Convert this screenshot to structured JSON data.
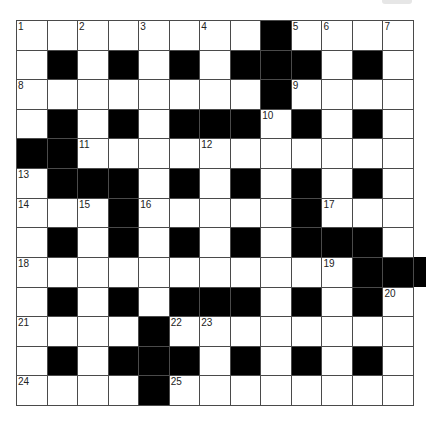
{
  "puzzle": {
    "type": "crossword",
    "rows": 13,
    "cols": 13,
    "colors": {
      "block": "#000000",
      "cell": "#ffffff",
      "gridline": "#4a4a4a"
    },
    "layout": [
      "WWWWWWWWBWWWW",
      "WBWBWBWBBBWBW",
      "WWWWWWWWBWWWW",
      "WBWBWBBBWBWBW",
      "BBWWWWWWWWWWW",
      "WBBBWBWBWBWBW",
      "WWWBWWWWWBWWW",
      "WBWBWBWBWBBBW",
      "WWWWWWWWWWWBB",
      "WBWBWBBBWBWBW",
      "WWWWBWWWWWWWW",
      "WBWBBBWBWBWBW",
      "WWWWBWWWWWWWW"
    ],
    "numbers": [
      {
        "row": 0,
        "col": 0,
        "n": "1"
      },
      {
        "row": 0,
        "col": 2,
        "n": "2"
      },
      {
        "row": 0,
        "col": 4,
        "n": "3"
      },
      {
        "row": 0,
        "col": 6,
        "n": "4"
      },
      {
        "row": 0,
        "col": 9,
        "n": "5"
      },
      {
        "row": 0,
        "col": 10,
        "n": "6"
      },
      {
        "row": 0,
        "col": 12,
        "n": "7"
      },
      {
        "row": 2,
        "col": 0,
        "n": "8"
      },
      {
        "row": 2,
        "col": 9,
        "n": "9"
      },
      {
        "row": 3,
        "col": 8,
        "n": "10"
      },
      {
        "row": 4,
        "col": 2,
        "n": "11"
      },
      {
        "row": 4,
        "col": 6,
        "n": "12"
      },
      {
        "row": 5,
        "col": 0,
        "n": "13"
      },
      {
        "row": 6,
        "col": 0,
        "n": "14"
      },
      {
        "row": 6,
        "col": 2,
        "n": "15"
      },
      {
        "row": 6,
        "col": 4,
        "n": "16"
      },
      {
        "row": 6,
        "col": 10,
        "n": "17"
      },
      {
        "row": 8,
        "col": 0,
        "n": "18"
      },
      {
        "row": 8,
        "col": 10,
        "n": "19"
      },
      {
        "row": 9,
        "col": 12,
        "n": "20"
      },
      {
        "row": 10,
        "col": 0,
        "n": "21"
      },
      {
        "row": 10,
        "col": 5,
        "n": "22"
      },
      {
        "row": 10,
        "col": 6,
        "n": "23"
      },
      {
        "row": 12,
        "col": 0,
        "n": "24"
      },
      {
        "row": 12,
        "col": 5,
        "n": "25"
      }
    ]
  }
}
